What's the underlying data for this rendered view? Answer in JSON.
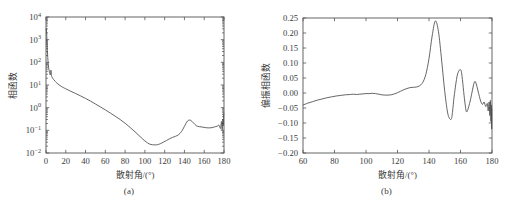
{
  "figure": {
    "panel_a_caption": "(a)",
    "panel_b_caption": "(b)"
  },
  "chart_data": [
    {
      "type": "line",
      "panel": "(a)",
      "title": "",
      "xlabel": "散射角/(°)",
      "ylabel": "相函数",
      "xlim": [
        0,
        180
      ],
      "ylim": [
        0.01,
        10000
      ],
      "yscale": "log",
      "xscale": "linear",
      "grid": false,
      "legend": null,
      "xticks": [
        0,
        20,
        40,
        60,
        80,
        100,
        120,
        140,
        160,
        180
      ],
      "xticklabels": [
        "0",
        "20",
        "40",
        "60",
        "80",
        "100",
        "120",
        "140",
        "160",
        "180"
      ],
      "yticks": [
        0.01,
        0.1,
        1,
        10,
        100,
        1000,
        10000
      ],
      "yticklabels": [
        "10-2",
        "10-1",
        "100",
        "101",
        "102",
        "103",
        "104"
      ],
      "ytick_mantissa": [
        "10",
        "10",
        "10",
        "10",
        "10",
        "10",
        "10"
      ],
      "ytick_exponent": [
        "-2",
        "-1",
        "0",
        "1",
        "2",
        "3",
        "4"
      ],
      "series": [
        {
          "name": "phase function",
          "x": [
            0,
            0.4,
            0.8,
            1.2,
            1.6,
            2.0,
            2.6,
            3.2,
            3.8,
            4.4,
            5.0,
            5.6,
            6.2,
            6.8,
            7.4,
            8.0,
            9.0,
            10.0,
            12.0,
            14.0,
            16.0,
            18.0,
            20.0,
            25.0,
            30.0,
            35.0,
            40.0,
            45.0,
            50.0,
            55.0,
            60.0,
            65.0,
            70.0,
            75.0,
            80.0,
            85.0,
            90.0,
            95.0,
            100.0,
            105.0,
            110.0,
            113.0,
            116.0,
            119.0,
            122.0,
            125.0,
            128.0,
            131.0,
            134.0,
            137.0,
            140.0,
            143.0,
            146.0,
            149.0,
            152.0,
            155.0,
            158.0,
            161.0,
            164.0,
            167.0,
            170.0,
            173.0,
            175.0,
            176.5,
            177.5,
            178.2,
            178.8,
            179.2,
            179.6,
            180.0
          ],
          "y": [
            2600,
            3000,
            1400,
            520,
            230,
            120,
            62,
            42,
            33,
            28,
            45,
            26,
            22,
            19.5,
            18,
            17,
            15,
            13.5,
            11.2,
            9.6,
            8.4,
            7.5,
            6.8,
            5.3,
            4.2,
            3.3,
            2.55,
            1.95,
            1.45,
            1.08,
            0.8,
            0.58,
            0.42,
            0.3,
            0.205,
            0.135,
            0.086,
            0.054,
            0.034,
            0.0245,
            0.0228,
            0.0235,
            0.0262,
            0.0305,
            0.036,
            0.0425,
            0.049,
            0.0545,
            0.064,
            0.088,
            0.15,
            0.255,
            0.28,
            0.215,
            0.16,
            0.145,
            0.14,
            0.132,
            0.128,
            0.13,
            0.14,
            0.152,
            0.168,
            0.12,
            0.245,
            0.105,
            0.3,
            0.16,
            0.42,
            0.56
          ]
        }
      ]
    },
    {
      "type": "line",
      "panel": "(b)",
      "title": "",
      "xlabel": "散射角/(°)",
      "ylabel": "偏振相函数",
      "xlim": [
        60,
        180
      ],
      "ylim": [
        -0.2,
        0.25
      ],
      "yscale": "linear",
      "xscale": "linear",
      "grid": false,
      "legend": null,
      "xticks": [
        60,
        80,
        100,
        120,
        140,
        160,
        180
      ],
      "xticklabels": [
        "60",
        "80",
        "100",
        "120",
        "140",
        "160",
        "180"
      ],
      "yticks": [
        0.25,
        0.2,
        0.15,
        0.1,
        0.05,
        0.0,
        -0.05,
        -0.1,
        -0.15,
        -0.2
      ],
      "yticklabels": [
        "0.25",
        "0.20",
        "0.15",
        "0.10",
        "0.05",
        "0.00",
        "-0.05",
        "-0.10",
        "-0.15",
        "-0.20"
      ],
      "series": [
        {
          "name": "polarized phase function",
          "x": [
            60,
            63,
            66,
            69,
            72,
            75,
            78,
            81,
            84,
            87,
            90,
            92,
            94,
            96,
            98,
            100,
            102,
            104,
            106,
            108,
            110,
            112,
            114,
            116,
            118,
            120,
            122,
            124,
            126,
            128,
            130,
            132,
            134,
            136,
            138,
            140,
            142,
            144,
            146,
            148,
            150,
            152,
            154,
            155,
            156,
            158,
            160,
            161,
            162,
            163,
            164,
            166,
            168,
            169,
            170,
            172,
            173,
            174,
            175,
            176,
            177,
            177.6,
            178.2,
            178.6,
            179.0,
            179.3,
            179.6,
            179.8,
            180
          ],
          "y": [
            -0.04,
            -0.034,
            -0.029,
            -0.024,
            -0.02,
            -0.016,
            -0.013,
            -0.01,
            -0.008,
            -0.006,
            -0.005,
            -0.004,
            -0.005,
            -0.004,
            -0.003,
            -0.002,
            -0.002,
            -0.001,
            -0.002,
            -0.004,
            -0.006,
            -0.007,
            -0.007,
            -0.006,
            -0.003,
            0.001,
            0.006,
            0.011,
            0.015,
            0.018,
            0.019,
            0.02,
            0.024,
            0.035,
            0.062,
            0.115,
            0.19,
            0.24,
            0.205,
            0.11,
            0.005,
            -0.07,
            -0.088,
            -0.06,
            -0.01,
            0.06,
            0.078,
            0.055,
            0.005,
            -0.04,
            -0.063,
            -0.03,
            0.02,
            0.038,
            0.03,
            -0.012,
            -0.03,
            -0.038,
            -0.03,
            -0.045,
            -0.035,
            -0.06,
            -0.03,
            -0.075,
            -0.025,
            -0.095,
            -0.04,
            -0.12,
            -0.055
          ]
        }
      ]
    }
  ]
}
